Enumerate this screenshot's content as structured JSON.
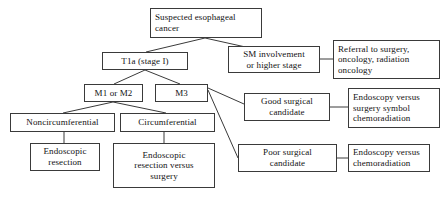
{
  "diagram": {
    "background_color": "#ffffff",
    "box_border_color": "#3a3a3a",
    "text_color": "#121212",
    "nodes": [
      {
        "id": "suspected",
        "label": "Suspected esophageal\ncancer",
        "align": "left"
      },
      {
        "id": "t1a",
        "label": "T1a (stage I)",
        "align": "center"
      },
      {
        "id": "sm_involvement",
        "label": "SM involvement\nor higher stage",
        "align": "center"
      },
      {
        "id": "referral",
        "label": "Referral to surgery,\noncology, radiation\noncology",
        "align": "left"
      },
      {
        "id": "m1_m2",
        "label": "M1 or M2",
        "align": "center"
      },
      {
        "id": "m3",
        "label": "M3",
        "align": "center"
      },
      {
        "id": "good_surgical",
        "label": "Good surgical\ncandidate",
        "align": "center"
      },
      {
        "id": "endoscopy_surgery_chemo",
        "label": "Endoscopy versus\nsurgery symbol\nchemoradiation",
        "align": "left"
      },
      {
        "id": "noncircumferential",
        "label": "Noncircumferential",
        "align": "center"
      },
      {
        "id": "circumferential",
        "label": "Circumferential",
        "align": "center"
      },
      {
        "id": "poor_surgical",
        "label": "Poor surgical\ncandidate",
        "align": "center"
      },
      {
        "id": "endoscopy_chemo",
        "label": "Endoscopy versus\nchemoradiation",
        "align": "left"
      },
      {
        "id": "endoscopic_resection",
        "label": "Endoscopic\nresection",
        "align": "center"
      },
      {
        "id": "endoscopic_resection_surgery",
        "label": "Endoscopic\nresection versus\nsurgery",
        "align": "center"
      }
    ]
  }
}
